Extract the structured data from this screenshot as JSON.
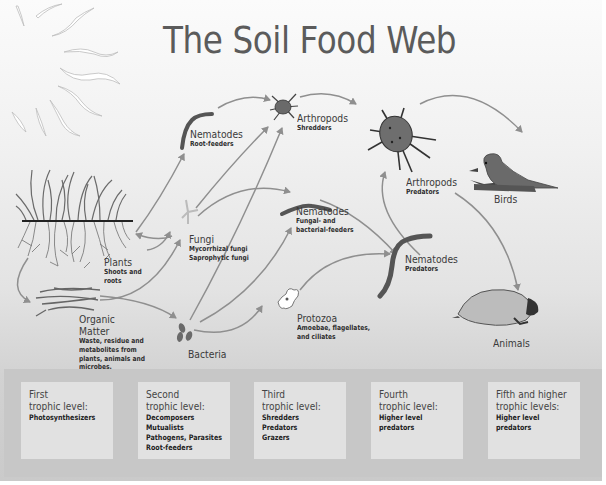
{
  "title": "The Soil Food Web",
  "nodes": {
    "plants": {
      "label": "Plants",
      "sub": [
        "Shoots and",
        "roots"
      ]
    },
    "organic_matter": {
      "label": [
        "Organic",
        "Matter"
      ],
      "sub": [
        "Waste, residue and",
        "metabolites from",
        "plants, animals and",
        "microbes."
      ]
    },
    "nematodes_root": {
      "label": "Nematodes",
      "sub": [
        "Root-feeders"
      ]
    },
    "fungi": {
      "label": "Fungi",
      "sub": [
        "Mycorrhizal fungi",
        "Saprophytic fungi"
      ]
    },
    "bacteria": {
      "label": "Bacteria"
    },
    "arthropods_shredders": {
      "label": "Arthropods",
      "sub": [
        "Shredders"
      ]
    },
    "nematodes_fungal": {
      "label": "Nematodes",
      "sub": [
        "Fungal- and",
        "bacterial-feeders"
      ]
    },
    "protozoa": {
      "label": "Protozoa",
      "sub": [
        "Amoebae, flagellates,",
        "and ciliates"
      ]
    },
    "arthropods_predators": {
      "label": "Arthropods",
      "sub": [
        "Predators"
      ]
    },
    "nematodes_predators": {
      "label": "Nematodes",
      "sub": [
        "Predators"
      ]
    },
    "birds": {
      "label": "Birds"
    },
    "animals": {
      "label": "Animals"
    }
  },
  "trophic_levels": [
    {
      "heading": [
        "First",
        "trophic level:"
      ],
      "items": [
        "Photosynthesizers"
      ]
    },
    {
      "heading": [
        "Second",
        "trophic level:"
      ],
      "items": [
        "Decomposers",
        "Mutualists",
        "Pathogens, Parasites",
        "Root-feeders"
      ]
    },
    {
      "heading": [
        "Third",
        "trophic level:"
      ],
      "items": [
        "Shredders",
        "Predators",
        "Grazers"
      ]
    },
    {
      "heading": [
        "Fourth",
        "trophic level:"
      ],
      "items": [
        "Higher level",
        "predators"
      ]
    },
    {
      "heading": [
        "Fifth and higher",
        "trophic levels:"
      ],
      "items": [
        "Higher level",
        "predators"
      ]
    }
  ],
  "colors": {
    "arrow": "#8f8f8f",
    "organism": "#5a5a5a",
    "title": "#5b5b5b",
    "level_band": "#c7c7c7",
    "level_box": "#e1e1e1"
  }
}
